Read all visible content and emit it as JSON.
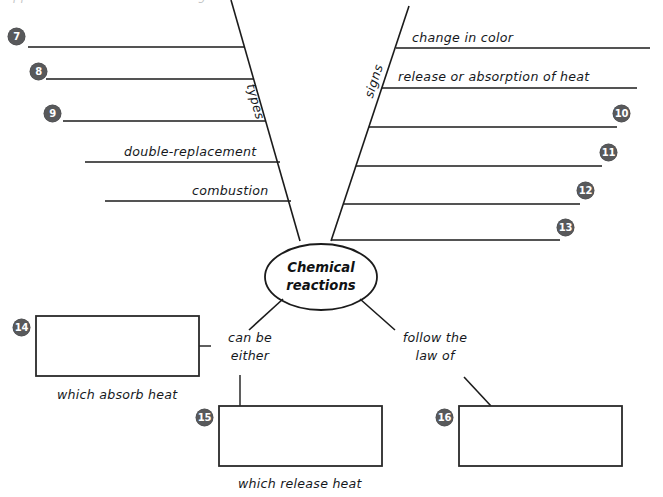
{
  "diagram": {
    "center_node": {
      "line1": "Chemical",
      "line2": "reactions"
    },
    "branch_labels": {
      "left_stem": "types",
      "right_stem": "signs"
    },
    "left_branch": {
      "name": "types",
      "entries": [
        {
          "badge": "7",
          "label": "",
          "filled": false
        },
        {
          "badge": "8",
          "label": "",
          "filled": false
        },
        {
          "badge": "9",
          "label": "",
          "filled": false
        },
        {
          "badge": "",
          "label": "double-replacement",
          "filled": true
        },
        {
          "badge": "",
          "label": "combustion",
          "filled": true
        }
      ]
    },
    "right_branch": {
      "name": "signs",
      "entries": [
        {
          "badge": "",
          "label": "change in color",
          "filled": true
        },
        {
          "badge": "",
          "label": "release or absorption of heat",
          "filled": true
        },
        {
          "badge": "10",
          "label": "",
          "filled": false
        },
        {
          "badge": "11",
          "label": "",
          "filled": false
        },
        {
          "badge": "12",
          "label": "",
          "filled": false
        },
        {
          "badge": "13",
          "label": "",
          "filled": false
        }
      ]
    },
    "bottom_branches": [
      {
        "connector": "can be\neither",
        "connector_line1": "can be",
        "connector_line2": "either",
        "boxes": [
          {
            "badge": "14",
            "caption": "which absorb heat",
            "value": ""
          },
          {
            "badge": "15",
            "caption": "which release heat",
            "value": ""
          }
        ]
      },
      {
        "connector": "follow the\nlaw of",
        "connector_line1": "follow the",
        "connector_line2": "law of",
        "boxes": [
          {
            "badge": "16",
            "caption": "",
            "value": ""
          }
        ]
      }
    ],
    "colors": {
      "ink": "#1b1b1b",
      "badge_fill": "#58595b",
      "badge_text": "#ffffff",
      "paper": "#ffffff"
    },
    "cropped_top_text": "clipped line of text above the diagram"
  }
}
